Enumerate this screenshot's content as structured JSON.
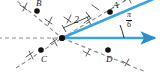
{
  "figure": {
    "type": "geometry-diagram",
    "width": 163,
    "height": 72
  },
  "colors": {
    "ray": "#3aa3dd",
    "ray_dark": "#2b8fc9",
    "dashed": "#8a8a8a",
    "point": "#121212",
    "label": "#1a1a1a",
    "background": "#ffffff"
  },
  "origin": {
    "label": "",
    "x": 62,
    "y": 38
  },
  "points": [
    {
      "id": "A",
      "label": "A",
      "x": 110,
      "y": 12,
      "on": "terminal-ray"
    },
    {
      "id": "B",
      "label": "B",
      "x": 37,
      "y": 11,
      "on": "dashed-line-bd"
    },
    {
      "id": "C",
      "label": "C",
      "x": 41,
      "y": 50,
      "on": "dashed-line-ac"
    },
    {
      "id": "D",
      "label": "D",
      "x": 108,
      "y": 50,
      "on": "dashed-line-bd"
    }
  ],
  "measures": {
    "segment_length": "2",
    "angle_numerator": "π",
    "angle_denominator": "6",
    "angle_text": "π/6"
  },
  "rays": [
    {
      "name": "initial-ray",
      "style": "solid-blue",
      "direction": "right",
      "arrow": true
    },
    {
      "name": "terminal-ray",
      "style": "solid-blue",
      "direction": "up-right",
      "arrow": true
    }
  ],
  "dashed_lines": [
    {
      "name": "horizontal-left",
      "direction": "left"
    },
    {
      "name": "line-through-b-and-d",
      "direction": "upper-left to lower-right"
    },
    {
      "name": "line-through-c-and-a",
      "direction": "lower-left to upper-right"
    }
  ]
}
